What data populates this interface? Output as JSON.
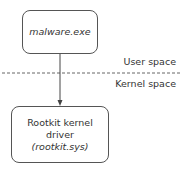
{
  "diagram": {
    "process_box": {
      "text": "malware.exe"
    },
    "driver_box": {
      "line1": "Rootkit kernel",
      "line2": "driver",
      "line3": "(rootkit.sys)"
    },
    "boundary": {
      "user_label": "User space",
      "kernel_label": "Kernel space"
    },
    "edges": [
      {
        "from": "malware.exe",
        "to": "Rootkit kernel driver (rootkit.sys)",
        "style": "solid-arrow"
      }
    ]
  }
}
